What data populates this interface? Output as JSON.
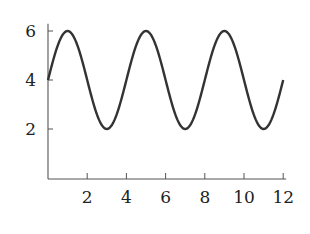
{
  "chart_data": {
    "type": "line",
    "title": "",
    "xlabel": "",
    "ylabel": "",
    "xlim": [
      0,
      12
    ],
    "ylim": [
      0,
      6.3
    ],
    "grid": false,
    "x_ticks": [
      2,
      4,
      6,
      8,
      10,
      12
    ],
    "y_ticks": [
      2,
      4,
      6
    ],
    "series": [
      {
        "name": "y = 4 + 2 sin(pi x / 2)",
        "x": [
          0,
          0.5,
          1,
          1.5,
          2,
          2.5,
          3,
          3.5,
          4,
          4.5,
          5,
          5.5,
          6,
          6.5,
          7,
          7.5,
          8,
          8.5,
          9,
          9.5,
          10,
          10.5,
          11,
          11.5,
          12
        ],
        "y": [
          4,
          5.41,
          6,
          5.41,
          4,
          2.59,
          2,
          2.59,
          4,
          5.41,
          6,
          5.41,
          4,
          2.59,
          2,
          2.59,
          4,
          5.41,
          6,
          5.41,
          4,
          2.59,
          2,
          2.59,
          4
        ]
      }
    ]
  },
  "axes": {
    "x_tick_labels": [
      "2",
      "4",
      "6",
      "8",
      "10",
      "12"
    ],
    "y_tick_labels": [
      "2",
      "4",
      "6"
    ]
  },
  "colors": {
    "line": "#333333",
    "axis": "#555555"
  }
}
